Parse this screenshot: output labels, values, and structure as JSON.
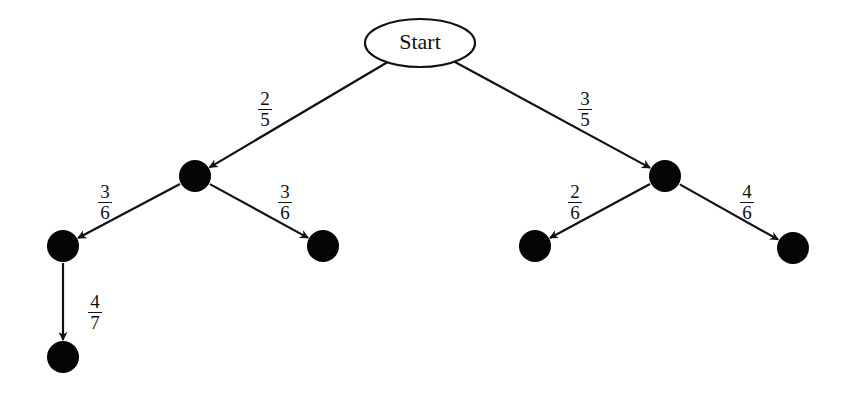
{
  "diagram": {
    "type": "probability-tree",
    "root": {
      "label": "Start",
      "cx": 420,
      "cy": 43,
      "rx": 55,
      "ry": 24
    },
    "nodes": [
      {
        "id": "n1",
        "cx": 195,
        "cy": 176,
        "r": 16
      },
      {
        "id": "n2",
        "cx": 665,
        "cy": 176,
        "r": 16
      },
      {
        "id": "n3",
        "cx": 63,
        "cy": 246,
        "r": 16
      },
      {
        "id": "n4",
        "cx": 323,
        "cy": 246,
        "r": 16
      },
      {
        "id": "n5",
        "cx": 535,
        "cy": 246,
        "r": 16
      },
      {
        "id": "n6",
        "cx": 793,
        "cy": 248,
        "r": 16
      },
      {
        "id": "n7",
        "cx": 63,
        "cy": 357,
        "r": 16
      }
    ],
    "edges": [
      {
        "from": "root",
        "to": "n1",
        "prob": {
          "num": "2",
          "den": "5"
        },
        "label_x": 255,
        "label_y": 90
      },
      {
        "from": "root",
        "to": "n2",
        "prob": {
          "num": "3",
          "den": "5"
        },
        "label_x": 575,
        "label_y": 90
      },
      {
        "from": "n1",
        "to": "n3",
        "prob": {
          "num": "3",
          "den": "6"
        },
        "label_x": 95,
        "label_y": 183
      },
      {
        "from": "n1",
        "to": "n4",
        "prob": {
          "num": "3",
          "den": "6"
        },
        "label_x": 275,
        "label_y": 183
      },
      {
        "from": "n2",
        "to": "n5",
        "prob": {
          "num": "2",
          "den": "6"
        },
        "label_x": 565,
        "label_y": 183
      },
      {
        "from": "n2",
        "to": "n6",
        "prob": {
          "num": "4",
          "den": "6"
        },
        "label_x": 737,
        "label_y": 183
      },
      {
        "from": "n3",
        "to": "n7",
        "prob": {
          "num": "4",
          "den": "7"
        },
        "label_x": 85,
        "label_y": 293
      }
    ],
    "colors": {
      "stroke": "#111111",
      "node_fill": "#050505",
      "background": "#ffffff"
    }
  }
}
